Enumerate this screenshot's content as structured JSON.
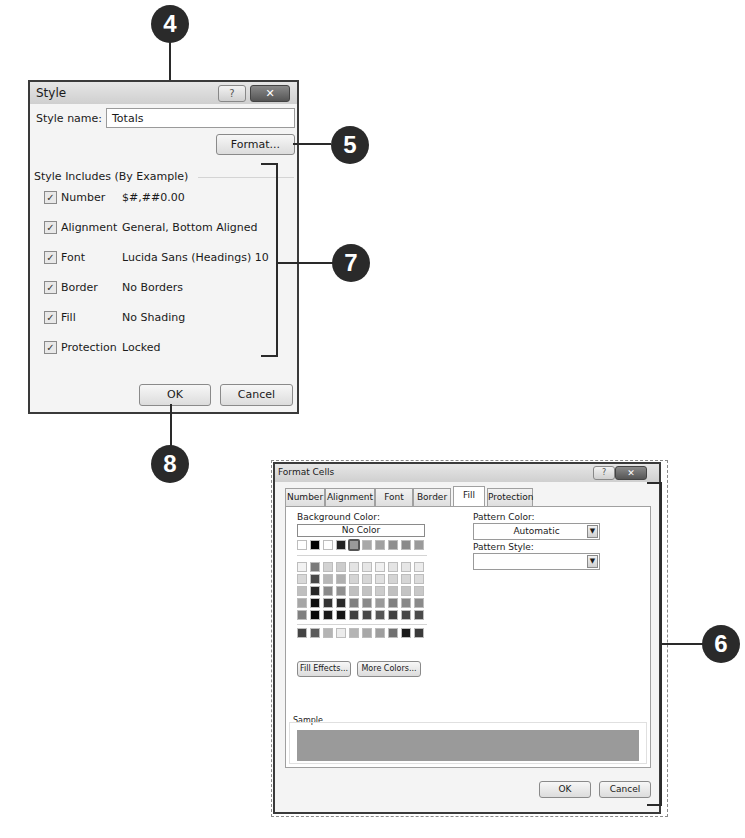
{
  "callouts": [
    {
      "number": "4",
      "target": "style-name-field"
    },
    {
      "number": "5",
      "target": "format-button"
    },
    {
      "number": "7",
      "target": "style-includes-group"
    },
    {
      "number": "8",
      "target": "ok-button"
    },
    {
      "number": "6",
      "target": "format-cells-dialog"
    }
  ],
  "style_dialog": {
    "title": "Style",
    "help_icon": "?",
    "close_icon": "✕",
    "style_name_label": "Style name:",
    "style_name_value": "Totals",
    "format_button": "Format...",
    "group_label": "Style Includes (By Example)",
    "items": [
      {
        "label": "Number",
        "value": "$#,##0.00",
        "checked": true
      },
      {
        "label": "Alignment",
        "value": "General, Bottom Aligned",
        "checked": true
      },
      {
        "label": "Font",
        "value": "Lucida Sans (Headings) 10",
        "checked": true
      },
      {
        "label": "Border",
        "value": "No Borders",
        "checked": true
      },
      {
        "label": "Fill",
        "value": "No Shading",
        "checked": true
      },
      {
        "label": "Protection",
        "value": "Locked",
        "checked": true
      }
    ],
    "ok_button": "OK",
    "cancel_button": "Cancel"
  },
  "format_cells": {
    "title": "Format Cells",
    "help_icon": "?",
    "close_icon": "✕",
    "tabs": [
      "Number",
      "Alignment",
      "Font",
      "Border",
      "Fill",
      "Protection"
    ],
    "active_tab": "Fill",
    "background_color_label": "Background Color:",
    "no_color_button": "No Color",
    "pattern_color_label": "Pattern Color:",
    "pattern_color_value": "Automatic",
    "pattern_style_label": "Pattern Style:",
    "pattern_style_value": "",
    "fill_effects_button": "Fill Effects...",
    "more_colors_button": "More Colors...",
    "sample_label": "Sample",
    "sample_color": "#9a9a9a",
    "ok_button": "OK",
    "cancel_button": "Cancel",
    "swatch_rows": [
      [
        "#ffffff",
        "#000000",
        "#ffffff",
        "#222222",
        "#9a9a9a",
        "#a8a8a8",
        "#a0a0a0",
        "#8e8e8e",
        "#8a8a8a",
        "#9a9a9a"
      ],
      [
        "#f2f2f2",
        "#7a7a7a",
        "#d2d2d2",
        "#cccccc",
        "#e4e4e4",
        "#e6e6e6",
        "#f0f0f0",
        "#e4e4e4",
        "#e6e6e6",
        "#ececec"
      ],
      [
        "#d8d8d8",
        "#484848",
        "#b8b8b8",
        "#b0b0b0",
        "#d4d4d4",
        "#d6d6d6",
        "#e0e0e0",
        "#d4d4d4",
        "#d6d6d6",
        "#dcdcdc"
      ],
      [
        "#bfbfbf",
        "#262626",
        "#8a8a8a",
        "#909090",
        "#c0c0c0",
        "#c2c2c2",
        "#cccccc",
        "#c0c0c0",
        "#c4c4c4",
        "#c8c8c8"
      ],
      [
        "#a6a6a6",
        "#0d0d0d",
        "#333333",
        "#2a2a2a",
        "#808080",
        "#8a8a8a",
        "#9a9a9a",
        "#808080",
        "#888888",
        "#8a8a8a"
      ],
      [
        "#7f7f7f",
        "#060606",
        "#1a1a1a",
        "#141414",
        "#404040",
        "#484848",
        "#555555",
        "#404040",
        "#454545",
        "#4a4a4a"
      ],
      [
        "#444444",
        "#5a5a5a",
        "#b4b4b4",
        "#ececec",
        "#b4b4b4",
        "#a8a8a8",
        "#9e9e9e",
        "#707070",
        "#1a1a1a",
        "#3a3a3a"
      ]
    ],
    "selected_swatch": {
      "row": 0,
      "col": 4
    }
  }
}
